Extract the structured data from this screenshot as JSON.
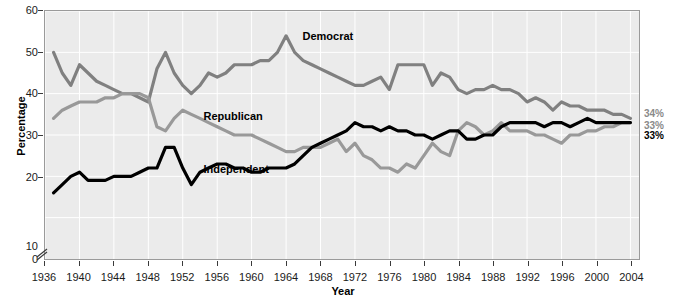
{
  "axes": {
    "ylabel": "Percentage",
    "xlabel": "Year",
    "yticks": [
      "60",
      "50",
      "40",
      "30",
      "20",
      "10",
      "0"
    ],
    "xticks": [
      "1936",
      "1940",
      "1944",
      "1948",
      "1952",
      "1956",
      "1960",
      "1964",
      "1968",
      "1972",
      "1976",
      "1980",
      "1984",
      "1988",
      "1992",
      "1996",
      "2000",
      "2004"
    ],
    "axis_break_icon": "axis-break-glyph"
  },
  "series_labels": {
    "democrat": "Democrat",
    "republican": "Republican",
    "independent": "Independent"
  },
  "end_labels": {
    "democrat": "34%",
    "republican": "33%",
    "independent": "33%"
  },
  "colors": {
    "democrat": "#808080",
    "republican": "#999999",
    "independent": "#000000",
    "plot_background": "#ebebeb",
    "gridline": "#ffffff",
    "frame": "#9a9a9a"
  },
  "chart_data": {
    "type": "line",
    "title": "",
    "xlabel": "Year",
    "ylabel": "Percentage",
    "xlim": [
      1936,
      2005
    ],
    "ylim": [
      0,
      60
    ],
    "ytick_values": [
      0,
      10,
      20,
      30,
      40,
      50,
      60
    ],
    "y_axis_break": "between 0 and 10",
    "grid": true,
    "legend": "inline-labels",
    "series": [
      {
        "name": "Democrat",
        "color": "#808080",
        "end_value_label": "34%",
        "x": [
          1937,
          1938,
          1939,
          1940,
          1941,
          1942,
          1943,
          1944,
          1945,
          1946,
          1947,
          1948,
          1949,
          1950,
          1951,
          1952,
          1953,
          1954,
          1955,
          1956,
          1957,
          1958,
          1959,
          1960,
          1961,
          1962,
          1963,
          1964,
          1965,
          1966,
          1967,
          1968,
          1969,
          1970,
          1971,
          1972,
          1973,
          1974,
          1975,
          1976,
          1977,
          1978,
          1979,
          1980,
          1981,
          1982,
          1983,
          1984,
          1985,
          1986,
          1987,
          1988,
          1989,
          1990,
          1991,
          1992,
          1993,
          1994,
          1995,
          1996,
          1997,
          1998,
          1999,
          2000,
          2001,
          2002,
          2003,
          2004
        ],
        "y": [
          50,
          45,
          42,
          47,
          45,
          43,
          42,
          41,
          40,
          40,
          39,
          38,
          46,
          50,
          45,
          42,
          40,
          42,
          45,
          44,
          45,
          47,
          47,
          47,
          48,
          48,
          50,
          54,
          50,
          48,
          47,
          46,
          45,
          44,
          43,
          42,
          42,
          43,
          44,
          41,
          47,
          47,
          47,
          47,
          42,
          45,
          44,
          41,
          40,
          41,
          41,
          42,
          41,
          41,
          40,
          38,
          39,
          38,
          36,
          38,
          37,
          37,
          36,
          36,
          36,
          35,
          35,
          34
        ],
        "peak": {
          "year": 1964,
          "value": 54
        }
      },
      {
        "name": "Republican",
        "color": "#999999",
        "end_value_label": "33%",
        "x": [
          1937,
          1938,
          1939,
          1940,
          1941,
          1942,
          1943,
          1944,
          1945,
          1946,
          1947,
          1948,
          1949,
          1950,
          1951,
          1952,
          1953,
          1954,
          1955,
          1956,
          1957,
          1958,
          1959,
          1960,
          1961,
          1962,
          1963,
          1964,
          1965,
          1966,
          1967,
          1968,
          1969,
          1970,
          1971,
          1972,
          1973,
          1974,
          1975,
          1976,
          1977,
          1978,
          1979,
          1980,
          1981,
          1982,
          1983,
          1984,
          1985,
          1986,
          1987,
          1988,
          1989,
          1990,
          1991,
          1992,
          1993,
          1994,
          1995,
          1996,
          1997,
          1998,
          1999,
          2000,
          2001,
          2002,
          2003,
          2004
        ],
        "y": [
          34,
          36,
          37,
          38,
          38,
          38,
          39,
          39,
          40,
          40,
          40,
          39,
          32,
          31,
          34,
          36,
          35,
          34,
          33,
          32,
          31,
          30,
          30,
          30,
          29,
          28,
          27,
          26,
          26,
          27,
          27,
          27,
          28,
          29,
          26,
          28,
          25,
          24,
          22,
          22,
          21,
          23,
          22,
          25,
          28,
          26,
          25,
          31,
          33,
          32,
          30,
          31,
          33,
          31,
          31,
          31,
          30,
          30,
          29,
          28,
          30,
          30,
          31,
          31,
          32,
          32,
          33,
          33
        ],
        "peak": {
          "year": 1953,
          "value": 36
        },
        "trough": {
          "year": 1977,
          "value": 21
        }
      },
      {
        "name": "Independent",
        "color": "#000000",
        "end_value_label": "33%",
        "x": [
          1937,
          1938,
          1939,
          1940,
          1941,
          1942,
          1943,
          1944,
          1945,
          1946,
          1947,
          1948,
          1949,
          1950,
          1951,
          1952,
          1953,
          1954,
          1955,
          1956,
          1957,
          1958,
          1959,
          1960,
          1961,
          1962,
          1963,
          1964,
          1965,
          1966,
          1967,
          1968,
          1969,
          1970,
          1971,
          1972,
          1973,
          1974,
          1975,
          1976,
          1977,
          1978,
          1979,
          1980,
          1981,
          1982,
          1983,
          1984,
          1985,
          1986,
          1987,
          1988,
          1989,
          1990,
          1991,
          1992,
          1993,
          1994,
          1995,
          1996,
          1997,
          1998,
          1999,
          2000,
          2001,
          2002,
          2003,
          2004
        ],
        "y": [
          16,
          18,
          20,
          21,
          19,
          19,
          19,
          20,
          20,
          20,
          21,
          22,
          22,
          27,
          27,
          22,
          18,
          21,
          22,
          23,
          23,
          22,
          22,
          21,
          21,
          22,
          22,
          22,
          23,
          25,
          27,
          28,
          29,
          30,
          31,
          33,
          32,
          32,
          31,
          32,
          31,
          31,
          30,
          30,
          29,
          30,
          31,
          31,
          29,
          29,
          30,
          30,
          32,
          33,
          33,
          33,
          33,
          32,
          33,
          33,
          32,
          33,
          34,
          33,
          33,
          33,
          33,
          33
        ]
      }
    ]
  }
}
